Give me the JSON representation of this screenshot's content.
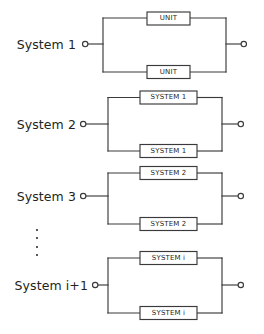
{
  "figure": {
    "kind": "reliability-block-diagram",
    "line_color": "#3a3a3c",
    "text_color": "#231f20",
    "background": "#ffffff",
    "box_fill": "#ffffff"
  },
  "systems": [
    {
      "id": "system-1",
      "label": "System 1",
      "top_block_label": "UNIT",
      "bottom_block_label": "UNIT",
      "left_terminal": "o",
      "right_terminal": "o"
    },
    {
      "id": "system-2",
      "label": "System 2",
      "top_block_label": "SYSTEM 1",
      "bottom_block_label": "SYSTEM 1",
      "left_terminal": "o",
      "right_terminal": "o"
    },
    {
      "id": "system-3",
      "label": "System 3",
      "top_block_label": "SYSTEM 2",
      "bottom_block_label": "SYSTEM 2",
      "left_terminal": "o",
      "right_terminal": "o"
    },
    {
      "id": "system-i-plus-1",
      "label": "System i+1",
      "top_block_label": "SYSTEM i",
      "bottom_block_label": "SYSTEM i",
      "left_terminal": "o",
      "right_terminal": "o"
    }
  ],
  "ellipsis": {
    "label": "vertical-ellipsis",
    "dot_count": 4
  }
}
